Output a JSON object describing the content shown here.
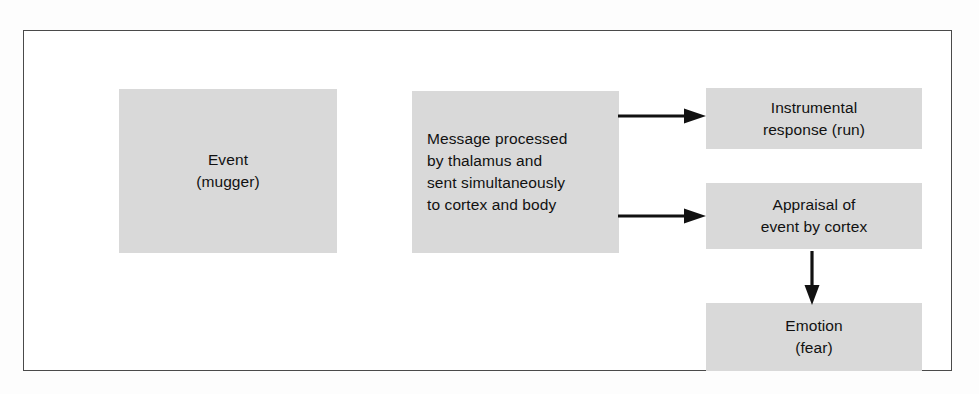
{
  "figure": {
    "frame": {
      "border_color": "#4a4a4a",
      "background_color": "#ffffff"
    },
    "box_fill_color": "#d9d9d9",
    "text_color": "#111111",
    "arrow_color": "#111111",
    "nodes": [
      {
        "id": "event",
        "label": "Event\n(mugger)",
        "align": "center"
      },
      {
        "id": "message",
        "label": "Message processed\nby thalamus and\nsent simultaneously\nto cortex and body",
        "align": "left"
      },
      {
        "id": "instrumental",
        "label": "Instrumental\nresponse (run)",
        "align": "center"
      },
      {
        "id": "appraisal",
        "label": "Appraisal of\nevent by cortex",
        "align": "center"
      },
      {
        "id": "emotion",
        "label": "Emotion\n(fear)",
        "align": "center"
      }
    ],
    "arrows": [
      {
        "id": "message-to-instrumental",
        "from": "message",
        "to": "instrumental",
        "direction": "right"
      },
      {
        "id": "message-to-appraisal",
        "from": "message",
        "to": "appraisal",
        "direction": "right"
      },
      {
        "id": "appraisal-to-emotion",
        "from": "appraisal",
        "to": "emotion",
        "direction": "down"
      }
    ]
  }
}
